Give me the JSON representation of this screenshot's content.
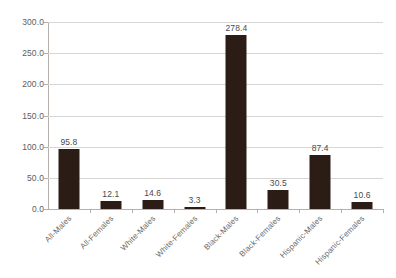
{
  "chart_data": {
    "type": "bar",
    "title": "",
    "subtitle": "",
    "xlabel": "",
    "ylabel": "",
    "categories": [
      "All-Males",
      "All-Females",
      "White-Males",
      "White-Females",
      "Black-Males",
      "Black-Females",
      "Hispanic-Males",
      "Hispanic-Females"
    ],
    "values": [
      95.8,
      12.1,
      14.6,
      3.3,
      278.4,
      30.5,
      87.4,
      10.6
    ],
    "value_labels": [
      "95.8",
      "12.1",
      "14.6",
      "3.3",
      "278.4",
      "30.5",
      "87.4",
      "10.6"
    ],
    "ylim": [
      0,
      300
    ],
    "ytick_values": [
      0,
      50,
      100,
      150,
      200,
      250,
      300
    ],
    "ytick_labels": [
      "0.0",
      "50.0",
      "100.0",
      "150.0",
      "200.0",
      "250.0",
      "300.0"
    ],
    "grid": true,
    "grid_axis": "y",
    "legend": false,
    "legend_position": "none",
    "bar_color": "#2b1d15",
    "gridline_color": "#d6d6d6",
    "axis_color": "#b5b0ab",
    "tick_label_color": "#5d5d5d",
    "category_label_color": "#6b6b6b",
    "value_label_color": "#4a4a4a",
    "background_color": "#ffffff",
    "category_label_rotation": -45,
    "series": [
      {
        "name": "",
        "values": [
          95.8,
          12.1,
          14.6,
          3.3,
          278.4,
          30.5,
          87.4,
          10.6
        ]
      }
    ]
  }
}
